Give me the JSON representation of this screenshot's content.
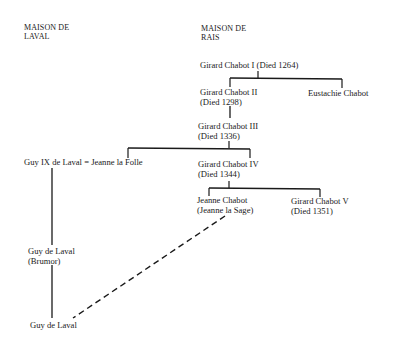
{
  "headers": {
    "laval_line1": "MAISON DE",
    "laval_line2": "LAVAL",
    "rais_line1": "MAISON DE",
    "rais_line2": "RAIS"
  },
  "people": {
    "girard_chabot_1": {
      "name": "Girard Chabot I (Died 1264)"
    },
    "girard_chabot_2": {
      "name": "Girard Chabot II",
      "note": "(Died 1298)"
    },
    "eustachie_chabot": {
      "name": "Eustachie Chabot"
    },
    "girard_chabot_3": {
      "name": "Girard Chabot III",
      "note": "(Died 1336)"
    },
    "guy_ix_marriage": {
      "name": "Guy IX de Laval = Jeanne la Folle"
    },
    "girard_chabot_4": {
      "name": "Girard Chabot IV",
      "note": "(Died 1344)"
    },
    "jeanne_chabot": {
      "name": "Jeanne Chabot",
      "note": "(Jeanne la Sage)"
    },
    "girard_chabot_5": {
      "name": "Girard Chabot V",
      "note": "(Died 1351)"
    },
    "guy_de_laval_brumor": {
      "name": "Guy de Laval",
      "note": "(Brumor)"
    },
    "guy_de_laval": {
      "name": "Guy de Laval"
    }
  },
  "connectors": {
    "solid_color": "#1a1a1a",
    "dashed_link": "Jeanne Chabot (Jeanne la Sage) — Guy de Laval"
  }
}
